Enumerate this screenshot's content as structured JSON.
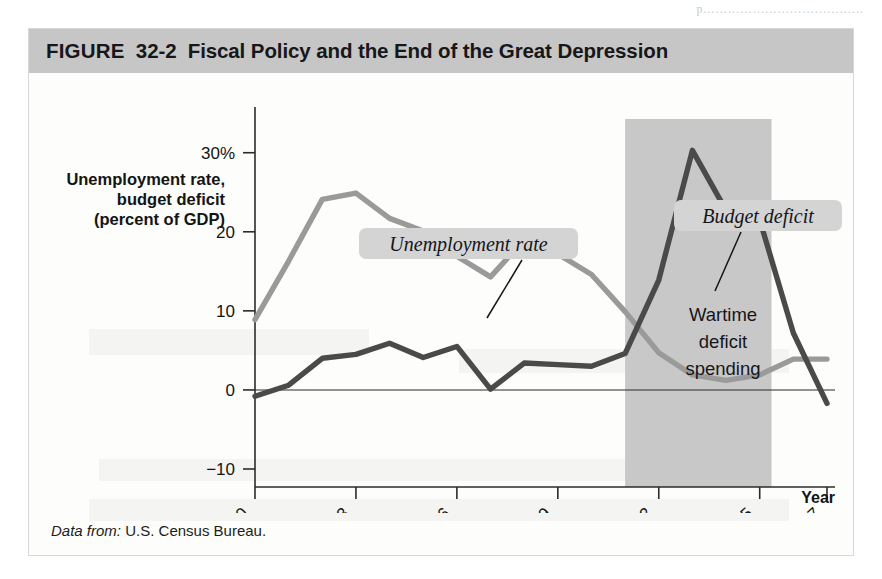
{
  "page_bleed_text": "p…………………………………",
  "figure": {
    "kicker": "FIGURE",
    "number": "32-2",
    "title": "Fiscal Policy and the End of the Great Depression",
    "source_label": "Data from:",
    "source_text": "U.S. Census Bureau."
  },
  "colors": {
    "title_bar": "#c6c6c6",
    "unemployment_line": "#9a9a9a",
    "deficit_line": "#4a4a4a",
    "band_fill": "#c8c8c8",
    "callout_fill": "#d4d4d4",
    "axis": "#2b2b2b",
    "card_bg": "#fdfdfb"
  },
  "chart_data": {
    "type": "line",
    "title": "Fiscal Policy and the End of the Great Depression",
    "xlabel": "Year",
    "ylabel": "Unemployment rate, budget deficit (percent of GDP)",
    "ylabel_lines": [
      "Unemployment rate,",
      "budget deficit",
      "(percent of GDP)"
    ],
    "x": [
      1930,
      1931,
      1932,
      1933,
      1934,
      1935,
      1936,
      1937,
      1938,
      1939,
      1940,
      1941,
      1942,
      1943,
      1944,
      1945,
      1946,
      1947
    ],
    "xlim": [
      1930,
      1947
    ],
    "ylim": [
      -10,
      33
    ],
    "xticks": [
      1930,
      1933,
      1936,
      1939,
      1942,
      1945,
      1947
    ],
    "xticklabels": [
      "1930",
      "1933",
      "1936",
      "1939",
      "1942",
      "1945",
      "1947"
    ],
    "yticks": [
      -10,
      0,
      10,
      20,
      30
    ],
    "yticklabels": [
      "−10",
      "0",
      "10",
      "20",
      "30%"
    ],
    "grid": false,
    "zero_line": true,
    "legend_position": "callouts",
    "series": [
      {
        "name": "Unemployment rate",
        "color": "#9a9a9a",
        "values": [
          8.9,
          16.3,
          24.1,
          24.9,
          21.7,
          20.1,
          16.9,
          14.3,
          19.0,
          17.2,
          14.6,
          9.9,
          4.7,
          1.9,
          1.2,
          1.9,
          3.9,
          3.9
        ]
      },
      {
        "name": "Budget deficit",
        "color": "#4a4a4a",
        "values": [
          -0.8,
          0.6,
          4.0,
          4.5,
          5.9,
          4.1,
          5.5,
          0.1,
          3.4,
          3.2,
          3.0,
          4.6,
          13.9,
          30.3,
          22.7,
          21.5,
          7.2,
          -1.7
        ]
      }
    ],
    "annotations": [
      {
        "name": "unemployment-callout",
        "text": "Unemployment rate",
        "style": "italic-box",
        "box_x": 330,
        "box_y": 155,
        "box_w": 219,
        "box_h": 31,
        "leader_from_x": 493,
        "leader_from_y": 187,
        "leader_to_x": 458,
        "leader_to_y": 245
      },
      {
        "name": "budget-deficit-callout",
        "text": "Budget deficit",
        "style": "italic-box",
        "box_x": 645,
        "box_y": 127,
        "box_w": 168,
        "box_h": 31,
        "leader_from_x": 712,
        "leader_from_y": 159,
        "leader_to_x": 686,
        "leader_to_y": 218
      },
      {
        "name": "wartime-band-label",
        "text": "Wartime deficit spending",
        "lines": [
          "Wartime",
          "deficit",
          "spending"
        ],
        "style": "plain",
        "center_x": 694,
        "top_y": 248
      }
    ],
    "shaded_band": {
      "label": "Wartime deficit spending",
      "x_start": 1941,
      "x_end": 1945.35,
      "fill": "#c8c8c8"
    }
  }
}
